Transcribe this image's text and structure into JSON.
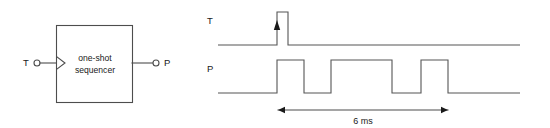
{
  "figure": {
    "line_color": "#4d4d4d",
    "wave_color": "#555555",
    "text_color": "#1a1a1a",
    "background": "#ffffff"
  },
  "block_diagram": {
    "box": {
      "line1": "one-shot",
      "line2": "sequencer",
      "x": 56,
      "y": 25,
      "width": 76,
      "height": 77
    },
    "input": {
      "label": "T",
      "label_x": 23,
      "label_y": 66,
      "circle_cx": 37,
      "circle_cy": 63,
      "circle_r": 3,
      "lead_x1": 40,
      "lead_x2": 56,
      "lead_y": 63,
      "trigger_marker": "edge-trigger-triangle"
    },
    "output": {
      "label": "P",
      "label_x": 164,
      "label_y": 66,
      "circle_cx": 156,
      "circle_cy": 63,
      "circle_r": 3,
      "lead_x1": 132,
      "lead_x2": 153,
      "lead_y": 63
    }
  },
  "timing_diagram": {
    "signals": [
      {
        "name": "T",
        "label": "T",
        "label_x": 207,
        "label_y": 24,
        "baseline_y": 45,
        "high_y": 12,
        "start_x": 218,
        "end_x": 520,
        "pulses": [
          {
            "rise_x": 277,
            "fall_x": 288
          }
        ],
        "edge_marker": {
          "type": "up-arrowhead",
          "x": 277,
          "tip_y": 20,
          "base_y": 30
        }
      },
      {
        "name": "P",
        "label": "P",
        "label_x": 207,
        "label_y": 72,
        "baseline_y": 93,
        "high_y": 60,
        "start_x": 218,
        "end_x": 520,
        "pulses": [
          {
            "rise_x": 277,
            "fall_x": 304
          },
          {
            "rise_x": 331,
            "fall_x": 392
          },
          {
            "rise_x": 421,
            "fall_x": 448
          }
        ]
      }
    ],
    "dimension": {
      "label": "6 ms",
      "x1": 278,
      "x2": 448,
      "y": 110,
      "label_x": 363,
      "label_y": 124
    }
  }
}
